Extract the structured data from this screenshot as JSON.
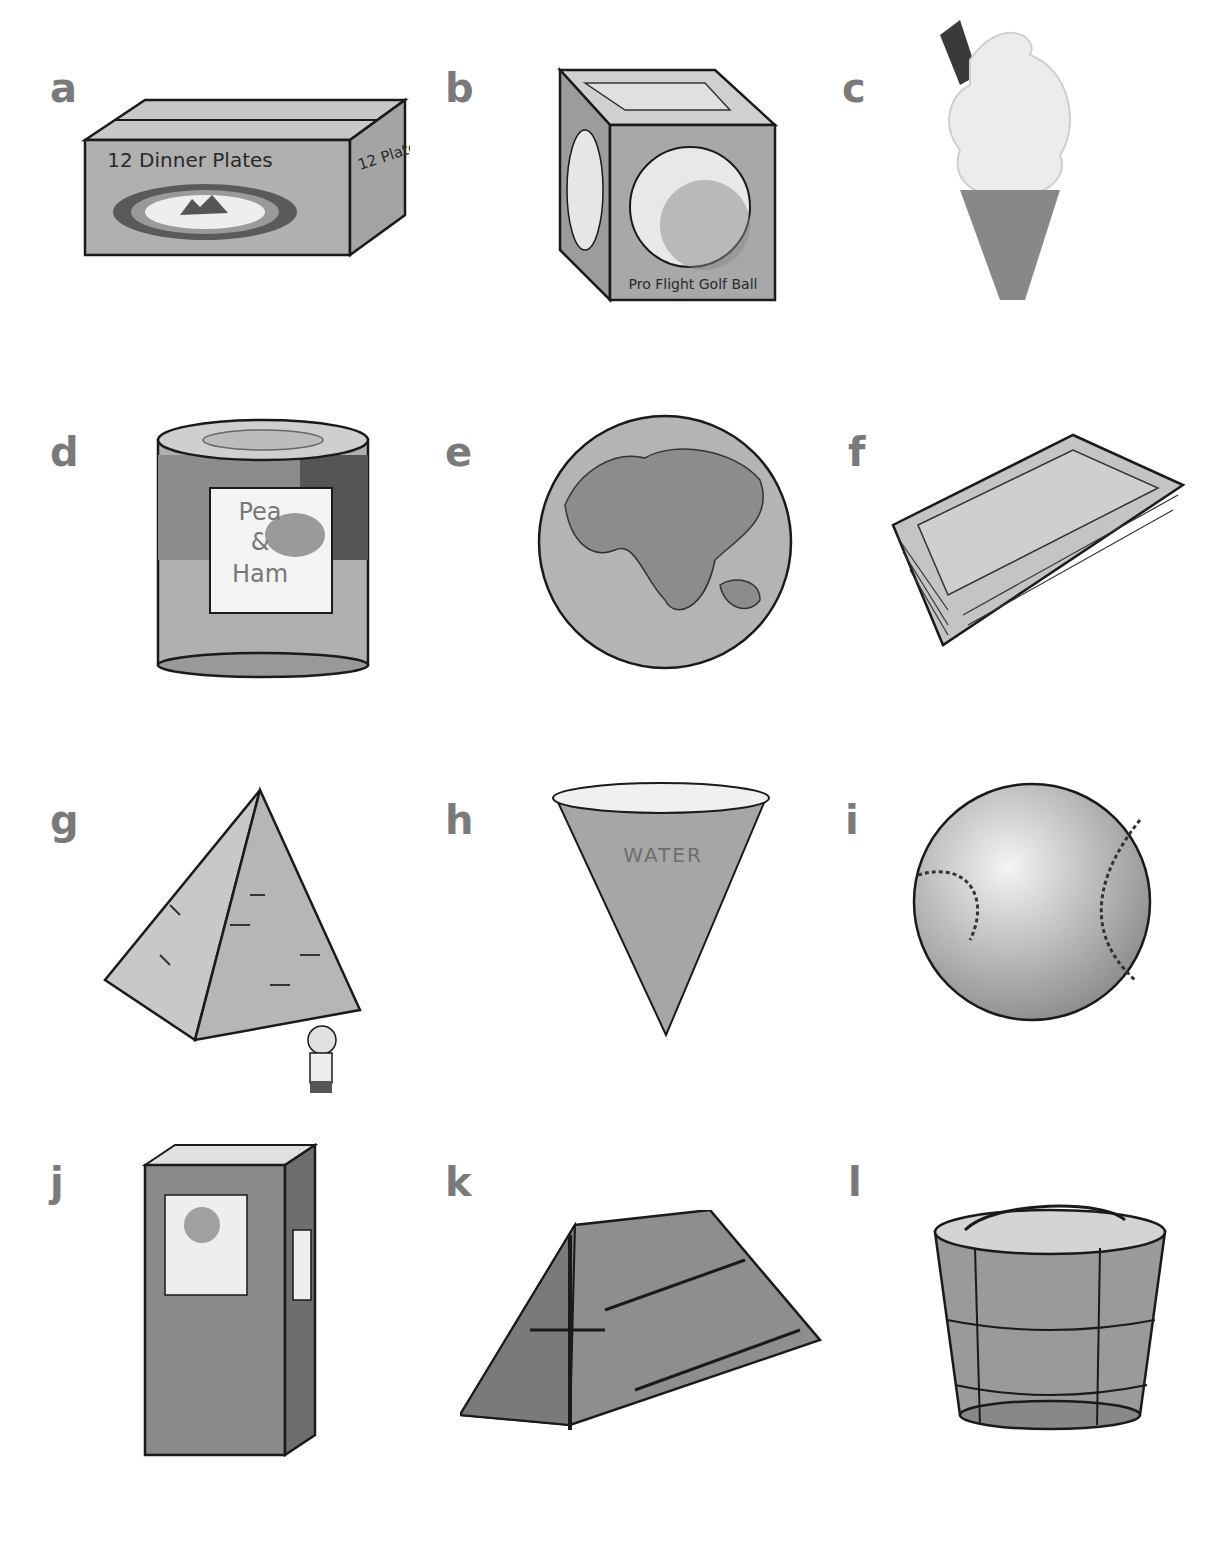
{
  "items": [
    {
      "letter": "a",
      "object": "box",
      "front_text": "12 Dinner Plates",
      "side_text": "12 Plates"
    },
    {
      "letter": "b",
      "object": "cube-box",
      "front_text": "Pro Flight Golf Ball"
    },
    {
      "letter": "c",
      "object": "ice-cream-cone"
    },
    {
      "letter": "d",
      "object": "can",
      "label_line1": "Pea",
      "label_line2": "&",
      "label_line3": "Ham"
    },
    {
      "letter": "e",
      "object": "globe"
    },
    {
      "letter": "f",
      "object": "tray"
    },
    {
      "letter": "g",
      "object": "pyramid"
    },
    {
      "letter": "h",
      "object": "cone-cup",
      "text": "WATER"
    },
    {
      "letter": "i",
      "object": "baseball"
    },
    {
      "letter": "j",
      "object": "book"
    },
    {
      "letter": "k",
      "object": "tent"
    },
    {
      "letter": "l",
      "object": "bucket"
    }
  ],
  "colors": {
    "letter": "#7a7a7a",
    "fill": "#a8a8a8",
    "outline": "#1a1a1a"
  }
}
